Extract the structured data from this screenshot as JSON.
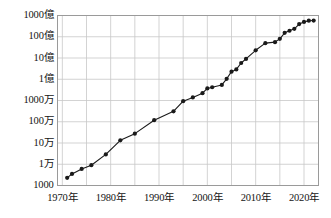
{
  "chart_data": {
    "type": "line",
    "title": "",
    "subtitle": "",
    "xlabel": "",
    "ylabel": "",
    "yscale": "log",
    "grid": true,
    "legend": null,
    "xlim": [
      1969,
      2023
    ],
    "ylim": [
      1000,
      100000000000
    ],
    "y_ticks": [
      {
        "value": 1000,
        "label": "1000"
      },
      {
        "value": 10000,
        "label": "1万"
      },
      {
        "value": 100000,
        "label": "10万"
      },
      {
        "value": 1000000,
        "label": "100万"
      },
      {
        "value": 10000000,
        "label": "1000万"
      },
      {
        "value": 100000000,
        "label": "1億"
      },
      {
        "value": 1000000000,
        "label": "10億"
      },
      {
        "value": 10000000000,
        "label": "100億"
      },
      {
        "value": 100000000000,
        "label": "1000億"
      }
    ],
    "x_ticks": [
      {
        "value": 1970,
        "label": "1970年"
      },
      {
        "value": 1975,
        "label": ""
      },
      {
        "value": 1980,
        "label": "1980年"
      },
      {
        "value": 1985,
        "label": ""
      },
      {
        "value": 1990,
        "label": "1990年"
      },
      {
        "value": 1995,
        "label": ""
      },
      {
        "value": 2000,
        "label": "2000年"
      },
      {
        "value": 2005,
        "label": ""
      },
      {
        "value": 2010,
        "label": "2010年"
      },
      {
        "value": 2015,
        "label": ""
      },
      {
        "value": 2020,
        "label": "2020年"
      }
    ],
    "x": [
      1971,
      1972,
      1974,
      1976,
      1979,
      1982,
      1985,
      1989,
      1993,
      1995,
      1997,
      1999,
      2000,
      2001,
      2003,
      2004,
      2005,
      2006,
      2007,
      2008,
      2010,
      2012,
      2014,
      2015,
      2016,
      2017,
      2018,
      2019,
      2020,
      2021,
      2022
    ],
    "values": [
      2300,
      3500,
      6000,
      9000,
      29000,
      134000,
      275000,
      1180000,
      3100000,
      9300000,
      14000000,
      22000000,
      37000000,
      42000000,
      54000000,
      105000000,
      228000000,
      291000000,
      582000000,
      904000000,
      2300000000,
      5000000000,
      5560000000,
      8000000000,
      15300000000,
      19200000000,
      23600000000,
      39540000000,
      50000000000,
      57000000000,
      58000000000
    ],
    "series_name": "",
    "marker": "circle",
    "marker_color": "#1a1a1a",
    "line_color": "#1a1a1a",
    "grid_color": "#c8c8c8",
    "frame_color": "#9a9a9a",
    "background_color": "#ffffff"
  }
}
